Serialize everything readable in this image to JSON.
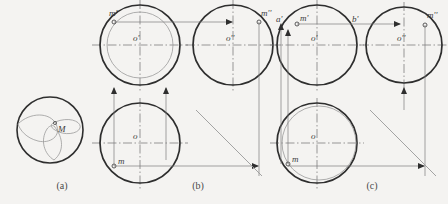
{
  "figure": {
    "background_color": "#f4f3f1",
    "line_color": "#2e2e2e",
    "thin_line_color": "#8a8a8a",
    "center_line_color": "#6e6e6e"
  },
  "captions": {
    "a": "(a)",
    "b": "(b)",
    "c": "(c)"
  },
  "panel_a": {
    "name": "pictorial-sphere",
    "sphere": {
      "cx": 50,
      "cy": 130,
      "r": 33
    },
    "point_label": "M",
    "point": {
      "cx": 55,
      "cy": 123
    },
    "arcs": [
      {
        "name": "equator-arc"
      },
      {
        "name": "meridian-arc"
      },
      {
        "name": "profile-arc"
      }
    ]
  },
  "panel_b": {
    "name": "projection-case-b",
    "views": {
      "front": {
        "label": "front-view",
        "center_label": "o'",
        "circle": {
          "cx": 140,
          "cy": 45,
          "r": 40
        },
        "aux_circle": {
          "cx": 140,
          "cy": 45,
          "r": 33,
          "type": "horizontal-circle-trace"
        },
        "point_label": "m'",
        "point": {
          "cx": 114,
          "cy": 22
        }
      },
      "profile": {
        "label": "profile-view",
        "center_label": "o''",
        "circle": {
          "cx": 233,
          "cy": 45,
          "r": 40
        },
        "point_label": "m''",
        "point": {
          "cx": 259,
          "cy": 22
        }
      },
      "top": {
        "label": "top-view",
        "center_label": "o",
        "circle": {
          "cx": 140,
          "cy": 143,
          "r": 40
        },
        "point_label": "m",
        "point": {
          "cx": 114,
          "cy": 166
        }
      }
    },
    "miter_line": {
      "x1": 196,
      "y1": 110,
      "x2": 262,
      "y2": 176,
      "angle_deg": 45
    }
  },
  "panel_c": {
    "name": "projection-case-c",
    "views": {
      "front": {
        "label": "front-view",
        "center_label": "o'",
        "circle": {
          "cx": 317,
          "cy": 45,
          "r": 40
        },
        "point_label": "m'",
        "point": {
          "cx": 297,
          "cy": 24
        },
        "extra_labels": [
          {
            "text": "a'",
            "x": 276,
            "y": 22
          },
          {
            "text": "b'",
            "x": 352,
            "y": 22
          }
        ]
      },
      "profile": {
        "label": "profile-view",
        "center_label": "o''",
        "circle": {
          "cx": 404,
          "cy": 45,
          "r": 38
        },
        "point_label": "m''",
        "point": {
          "cx": 425,
          "cy": 25
        }
      },
      "top": {
        "label": "top-view",
        "center_label": "o",
        "circle": {
          "cx": 317,
          "cy": 143,
          "r": 40
        },
        "aux_circle": {
          "cx": 319,
          "cy": 143,
          "r": 37,
          "type": "horizontal-circle-trace"
        },
        "point_label": "m",
        "point": {
          "cx": 288,
          "cy": 164
        }
      }
    },
    "miter_line": {
      "x1": 370,
      "y1": 110,
      "x2": 436,
      "y2": 176,
      "angle_deg": 45
    }
  }
}
